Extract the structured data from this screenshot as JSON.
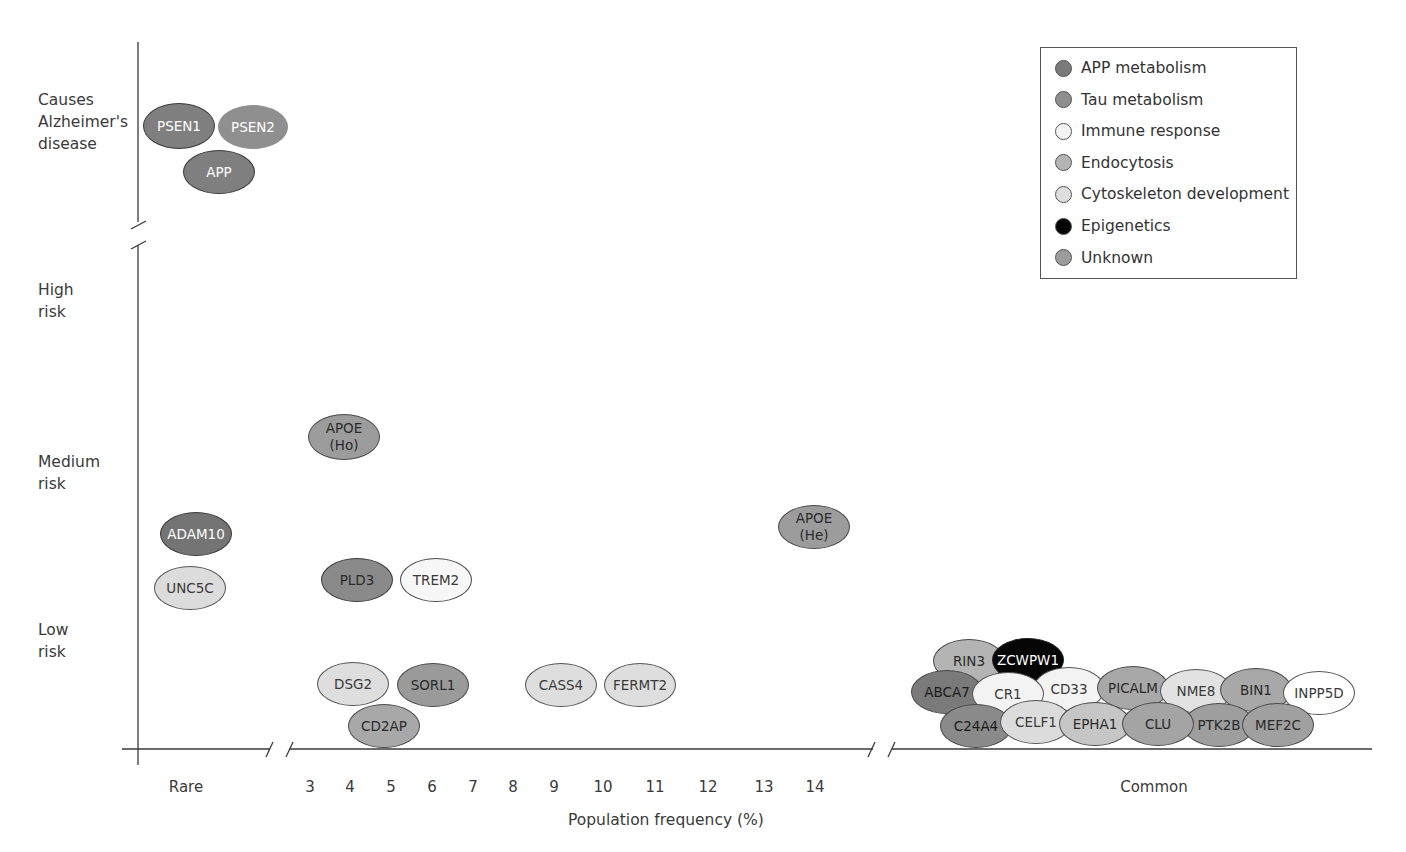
{
  "chart_data": {
    "type": "scatter",
    "title": "",
    "xlabel": "Population frequency (%)",
    "ylabel": "Risk of Alzheimer's disease",
    "x_ticks": [
      "Rare",
      "3",
      "4",
      "5",
      "6",
      "7",
      "8",
      "9",
      "10",
      "11",
      "12",
      "13",
      "14",
      "Common"
    ],
    "y_ticks": [
      "Causes\nAlzheimer's\ndisease",
      "High\nrisk",
      "Medium\nrisk",
      "Low\nrisk"
    ],
    "axis_breaks": {
      "x": [
        "between Rare and 3",
        "between 14 and Common"
      ],
      "y": [
        "between Causes Alzheimer's disease and High risk"
      ]
    },
    "grid": false,
    "legend_position": "top-right",
    "legend": [
      {
        "name": "APP metabolism",
        "color": "#7a7a7a"
      },
      {
        "name": "Tau metabolism",
        "color": "#8e8e8e"
      },
      {
        "name": "Immune response",
        "color": "#f3f3f3"
      },
      {
        "name": "Endocytosis",
        "color": "#b4b4b4"
      },
      {
        "name": "Cytoskeleton development",
        "color": "#dedede"
      },
      {
        "name": "Epigenetics",
        "color": "#050505"
      },
      {
        "name": "Unknown",
        "color": "#9c9c9c"
      }
    ],
    "genes": [
      {
        "label": "PSEN1",
        "frequency": "Rare",
        "risk": "Causes Alzheimer's disease",
        "category": "APP metabolism"
      },
      {
        "label": "PSEN2",
        "frequency": "Rare",
        "risk": "Causes Alzheimer's disease",
        "category": "APP metabolism"
      },
      {
        "label": "APP",
        "frequency": "Rare",
        "risk": "Causes Alzheimer's disease",
        "category": "APP metabolism"
      },
      {
        "label": "APOE (Ho)",
        "frequency": "4",
        "risk": "Medium risk",
        "category": "Unknown"
      },
      {
        "label": "APOE (He)",
        "frequency": "14",
        "risk": "Medium-low risk",
        "category": "Unknown"
      },
      {
        "label": "ADAM10",
        "frequency": "Rare",
        "risk": "Medium-low risk",
        "category": "APP metabolism"
      },
      {
        "label": "UNC5C",
        "frequency": "Rare",
        "risk": "Low-medium risk",
        "category": "Cytoskeleton development"
      },
      {
        "label": "PLD3",
        "frequency": "4",
        "risk": "Low-medium risk",
        "category": "APP metabolism"
      },
      {
        "label": "TREM2",
        "frequency": "5",
        "risk": "Low-medium risk",
        "category": "Immune response"
      },
      {
        "label": "DSG2",
        "frequency": "4",
        "risk": "Low risk",
        "category": "Cytoskeleton development"
      },
      {
        "label": "SORL1",
        "frequency": "6",
        "risk": "Low risk",
        "category": "Endocytosis"
      },
      {
        "label": "CD2AP",
        "frequency": "5",
        "risk": "Low risk",
        "category": "Endocytosis"
      },
      {
        "label": "CASS4",
        "frequency": "9",
        "risk": "Low risk",
        "category": "Cytoskeleton development"
      },
      {
        "label": "FERMT2",
        "frequency": "10.5",
        "risk": "Low risk",
        "category": "Cytoskeleton development"
      },
      {
        "label": "RIN3",
        "frequency": "Common",
        "risk": "Low risk",
        "category": "Endocytosis"
      },
      {
        "label": "ZCWPW1",
        "frequency": "Common",
        "risk": "Low risk",
        "category": "Epigenetics"
      },
      {
        "label": "ABCA7",
        "frequency": "Common",
        "risk": "Low risk",
        "category": "APP metabolism"
      },
      {
        "label": "CR1",
        "frequency": "Common",
        "risk": "Low risk",
        "category": "Immune response"
      },
      {
        "label": "CD33",
        "frequency": "Common",
        "risk": "Low risk",
        "category": "Immune response"
      },
      {
        "label": "PICALM",
        "frequency": "Common",
        "risk": "Low risk",
        "category": "Endocytosis"
      },
      {
        "label": "NME8",
        "frequency": "Common",
        "risk": "Low risk",
        "category": "Cytoskeleton development"
      },
      {
        "label": "BIN1",
        "frequency": "Common",
        "risk": "Low risk",
        "category": "Endocytosis"
      },
      {
        "label": "INPP5D",
        "frequency": "Common",
        "risk": "Low risk",
        "category": "Immune response"
      },
      {
        "label": "C24A4",
        "frequency": "Common",
        "risk": "Low risk",
        "category": "APP metabolism"
      },
      {
        "label": "CELF1",
        "frequency": "Common",
        "risk": "Low risk",
        "category": "Cytoskeleton development"
      },
      {
        "label": "EPHA1",
        "frequency": "Common",
        "risk": "Low risk",
        "category": "Cytoskeleton development"
      },
      {
        "label": "CLU",
        "frequency": "Common",
        "risk": "Low risk",
        "category": "Unknown"
      },
      {
        "label": "PTK2B",
        "frequency": "Common",
        "risk": "Low risk",
        "category": "Tau metabolism"
      },
      {
        "label": "MEF2C",
        "frequency": "Common",
        "risk": "Low risk",
        "category": "Unknown"
      }
    ]
  },
  "axes": {
    "xlabel": "Population frequency (%)",
    "y_labels": [
      {
        "text": "Causes\nAlzheimer's\ndisease",
        "top": 89
      },
      {
        "text": "High\nrisk",
        "top": 279
      },
      {
        "text": "Medium\nrisk",
        "top": 451
      },
      {
        "text": "Low\nrisk",
        "top": 619
      }
    ],
    "x_ticks": [
      {
        "text": "Rare",
        "x": 186
      },
      {
        "text": "3",
        "x": 310
      },
      {
        "text": "4",
        "x": 350
      },
      {
        "text": "5",
        "x": 391
      },
      {
        "text": "6",
        "x": 432
      },
      {
        "text": "7",
        "x": 473
      },
      {
        "text": "8",
        "x": 513
      },
      {
        "text": "9",
        "x": 554
      },
      {
        "text": "10",
        "x": 603
      },
      {
        "text": "11",
        "x": 655
      },
      {
        "text": "12",
        "x": 708
      },
      {
        "text": "13",
        "x": 764
      },
      {
        "text": "14",
        "x": 815
      },
      {
        "text": "Common",
        "x": 1154
      }
    ]
  },
  "legend": {
    "items": [
      {
        "label": "APP metabolism",
        "color": "#7a7a7a"
      },
      {
        "label": "Tau metabolism",
        "color": "#8e8e8e"
      },
      {
        "label": "Immune response",
        "color": "#f3f3f3"
      },
      {
        "label": "Endocytosis",
        "color": "#b4b4b4"
      },
      {
        "label": "Cytoskeleton development",
        "color": "#dedede"
      },
      {
        "label": "Epigenetics",
        "color": "#050505"
      },
      {
        "label": "Unknown",
        "color": "#9c9c9c"
      }
    ]
  },
  "genes": [
    {
      "label": "PSEN1",
      "cx": 179,
      "cy": 126,
      "w": 72,
      "h": 46,
      "fill": "#7f7f7f",
      "color": "#ffffff",
      "border": "#3a3a3a",
      "z": 2
    },
    {
      "label": "PSEN2",
      "cx": 253,
      "cy": 127,
      "w": 70,
      "h": 44,
      "fill": "#8f8f8f",
      "color": "#ffffff",
      "border": "#8f8f8f",
      "z": 1
    },
    {
      "label": "APP",
      "cx": 219,
      "cy": 172,
      "w": 72,
      "h": 44,
      "fill": "#7f7f7f",
      "color": "#ffffff",
      "border": "#3a3a3a",
      "z": 2
    },
    {
      "label": "APOE\n(Ho)",
      "cx": 344,
      "cy": 437,
      "w": 72,
      "h": 46,
      "fill": "#9c9c9c",
      "color": "#2a2a2a",
      "border": "#4a4a4a",
      "z": 1
    },
    {
      "label": "APOE\n(He)",
      "cx": 814,
      "cy": 527,
      "w": 72,
      "h": 44,
      "fill": "#9c9c9c",
      "color": "#2a2a2a",
      "border": "#4a4a4a",
      "z": 1
    },
    {
      "label": "ADAM10",
      "cx": 196,
      "cy": 534,
      "w": 72,
      "h": 44,
      "fill": "#747474",
      "color": "#ffffff",
      "border": "#3a3a3a",
      "z": 1
    },
    {
      "label": "UNC5C",
      "cx": 190,
      "cy": 588,
      "w": 72,
      "h": 44,
      "fill": "#dcdcdc",
      "color": "#3a3a3a",
      "border": "#555555",
      "z": 1
    },
    {
      "label": "PLD3",
      "cx": 357,
      "cy": 580,
      "w": 72,
      "h": 44,
      "fill": "#8a8a8a",
      "color": "#2a2a2a",
      "border": "#3a3a3a",
      "z": 1
    },
    {
      "label": "TREM2",
      "cx": 436,
      "cy": 580,
      "w": 72,
      "h": 44,
      "fill": "#f7f7f7",
      "color": "#3a3a3a",
      "border": "#4a4a4a",
      "z": 1
    },
    {
      "label": "DSG2",
      "cx": 353,
      "cy": 684,
      "w": 72,
      "h": 44,
      "fill": "#dedede",
      "color": "#3a3a3a",
      "border": "#555555",
      "z": 1
    },
    {
      "label": "SORL1",
      "cx": 433,
      "cy": 685,
      "w": 72,
      "h": 44,
      "fill": "#9a9a9a",
      "color": "#2a2a2a",
      "border": "#4a4a4a",
      "z": 1
    },
    {
      "label": "CD2AP",
      "cx": 384,
      "cy": 726,
      "w": 72,
      "h": 44,
      "fill": "#a8a8a8",
      "color": "#2a2a2a",
      "border": "#4a4a4a",
      "z": 2
    },
    {
      "label": "CASS4",
      "cx": 561,
      "cy": 685,
      "w": 72,
      "h": 44,
      "fill": "#dedede",
      "color": "#3a3a3a",
      "border": "#555555",
      "z": 1
    },
    {
      "label": "FERMT2",
      "cx": 640,
      "cy": 685,
      "w": 72,
      "h": 44,
      "fill": "#dedede",
      "color": "#3a3a3a",
      "border": "#555555",
      "z": 1
    },
    {
      "label": "RIN3",
      "cx": 969,
      "cy": 661,
      "w": 72,
      "h": 44,
      "fill": "#b4b4b4",
      "color": "#2a2a2a",
      "border": "#4a4a4a",
      "z": 1
    },
    {
      "label": "ZCWPW1",
      "cx": 1028,
      "cy": 660,
      "w": 72,
      "h": 44,
      "fill": "#050505",
      "color": "#ffffff",
      "border": "#222222",
      "z": 2
    },
    {
      "label": "ABCA7",
      "cx": 947,
      "cy": 692,
      "w": 72,
      "h": 44,
      "fill": "#7a7a7a",
      "color": "#1a1a1a",
      "border": "#4a4a4a",
      "z": 2
    },
    {
      "label": "CR1",
      "cx": 1008,
      "cy": 694,
      "w": 72,
      "h": 44,
      "fill": "#f3f3f3",
      "color": "#3a3a3a",
      "border": "#555555",
      "z": 4
    },
    {
      "label": "CD33",
      "cx": 1069,
      "cy": 689,
      "w": 72,
      "h": 44,
      "fill": "#f3f3f3",
      "color": "#3a3a3a",
      "border": "#555555",
      "z": 3
    },
    {
      "label": "PICALM",
      "cx": 1133,
      "cy": 688,
      "w": 72,
      "h": 44,
      "fill": "#a8a8a8",
      "color": "#2a2a2a",
      "border": "#4a4a4a",
      "z": 3
    },
    {
      "label": "NME8",
      "cx": 1196,
      "cy": 691,
      "w": 72,
      "h": 44,
      "fill": "#e2e2e2",
      "color": "#3a3a3a",
      "border": "#555555",
      "z": 3
    },
    {
      "label": "BIN1",
      "cx": 1256,
      "cy": 690,
      "w": 72,
      "h": 44,
      "fill": "#a8a8a8",
      "color": "#2a2a2a",
      "border": "#4a4a4a",
      "z": 3
    },
    {
      "label": "INPP5D",
      "cx": 1319,
      "cy": 693,
      "w": 72,
      "h": 44,
      "fill": "#ffffff",
      "color": "#3a3a3a",
      "border": "#555555",
      "z": 3
    },
    {
      "label": "C24A4",
      "cx": 976,
      "cy": 726,
      "w": 72,
      "h": 44,
      "fill": "#8a8a8a",
      "color": "#1a1a1a",
      "border": "#4a4a4a",
      "z": 5
    },
    {
      "label": "CELF1",
      "cx": 1036,
      "cy": 722,
      "w": 72,
      "h": 44,
      "fill": "#dcdcdc",
      "color": "#3a3a3a",
      "border": "#555555",
      "z": 5
    },
    {
      "label": "EPHA1",
      "cx": 1095,
      "cy": 724,
      "w": 72,
      "h": 44,
      "fill": "#c6c6c6",
      "color": "#2a2a2a",
      "border": "#4a4a4a",
      "z": 6
    },
    {
      "label": "CLU",
      "cx": 1158,
      "cy": 724,
      "w": 72,
      "h": 44,
      "fill": "#a4a4a4",
      "color": "#2a2a2a",
      "border": "#4a4a4a",
      "z": 7
    },
    {
      "label": "PTK2B",
      "cx": 1219,
      "cy": 725,
      "w": 72,
      "h": 44,
      "fill": "#9e9e9e",
      "color": "#2a2a2a",
      "border": "#4a4a4a",
      "z": 6
    },
    {
      "label": "MEF2C",
      "cx": 1278,
      "cy": 725,
      "w": 72,
      "h": 44,
      "fill": "#a0a0a0",
      "color": "#2a2a2a",
      "border": "#4a4a4a",
      "z": 7
    }
  ]
}
